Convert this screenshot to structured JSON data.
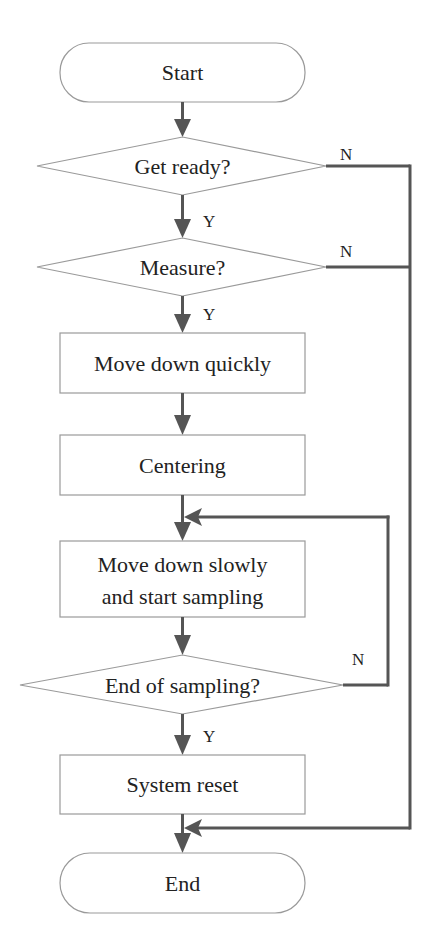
{
  "flowchart": {
    "colors": {
      "shape_stroke": "#9a9a9a",
      "connector": "#555555",
      "text": "#222222",
      "background": "#ffffff"
    },
    "nodes": {
      "start": {
        "type": "terminator",
        "label": "Start"
      },
      "get_ready": {
        "type": "decision",
        "label": "Get ready?"
      },
      "measure": {
        "type": "decision",
        "label": "Measure?"
      },
      "move_down_quickly": {
        "type": "process",
        "label": "Move down quickly"
      },
      "centering": {
        "type": "process",
        "label": "Centering"
      },
      "move_down_slowly": {
        "type": "process",
        "label_line1": "Move down slowly",
        "label_line2": "and start sampling"
      },
      "end_of_sampling": {
        "type": "decision",
        "label": "End of sampling?"
      },
      "system_reset": {
        "type": "process",
        "label": "System reset"
      },
      "end": {
        "type": "terminator",
        "label": "End"
      }
    },
    "edge_labels": {
      "get_ready_yes": "Y",
      "get_ready_no": "N",
      "measure_yes": "Y",
      "measure_no": "N",
      "end_of_sampling_yes": "Y",
      "end_of_sampling_no": "N"
    }
  }
}
